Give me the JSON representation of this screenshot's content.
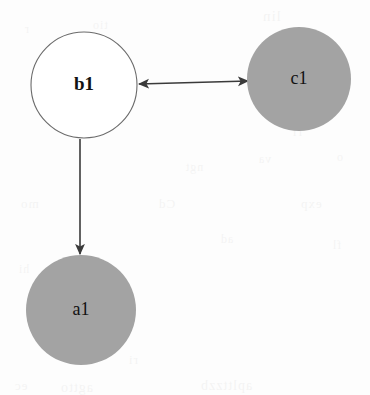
{
  "diagram": {
    "type": "directed-graph",
    "canvas": {
      "width": 370,
      "height": 395
    },
    "background_color": "#fdfdfd",
    "node_fill_gray": "#a3a3a3",
    "node_fill_white": "#ffffff",
    "node_stroke": "#5e5e5e",
    "edge_color": "#3a3a3a",
    "label_color": "#121212",
    "nodes": [
      {
        "id": "b1",
        "label": "b1",
        "cx": 84,
        "cy": 85,
        "r": 53,
        "fill": "#ffffff",
        "stroke": "#6b6b6b",
        "stroke_width": 1.1,
        "font_size": 19,
        "font_weight": "bold"
      },
      {
        "id": "c1",
        "label": "c1",
        "cx": 299,
        "cy": 79,
        "r": 52,
        "fill": "#a3a3a3",
        "stroke": "none",
        "stroke_width": 0,
        "font_size": 18,
        "font_weight": "normal"
      },
      {
        "id": "a1",
        "label": "a1",
        "cx": 81,
        "cy": 310,
        "r": 55,
        "fill": "#a3a3a3",
        "stroke": "none",
        "stroke_width": 0,
        "font_size": 18,
        "font_weight": "normal"
      }
    ],
    "edges": [
      {
        "id": "b1-c1",
        "from": "b1",
        "to": "c1",
        "direction": "bidirectional",
        "x1": 139,
        "y1": 84,
        "x2": 248,
        "y2": 81
      },
      {
        "id": "b1-a1",
        "from": "b1",
        "to": "a1",
        "direction": "forward",
        "x1": 80,
        "y1": 139,
        "x2": 80,
        "y2": 254
      }
    ],
    "ghost_text": [
      {
        "text": "lin",
        "x": 262,
        "y": 8,
        "size": 15
      },
      {
        "text": "tio",
        "x": 92,
        "y": 18,
        "size": 12
      },
      {
        "text": "r",
        "x": 24,
        "y": 22,
        "size": 12
      },
      {
        "text": "ri",
        "x": 292,
        "y": 124,
        "size": 13
      },
      {
        "text": "ngt",
        "x": 185,
        "y": 160,
        "size": 12
      },
      {
        "text": "va",
        "x": 258,
        "y": 152,
        "size": 12
      },
      {
        "text": "o",
        "x": 336,
        "y": 150,
        "size": 12
      },
      {
        "text": "mo",
        "x": 20,
        "y": 196,
        "size": 13
      },
      {
        "text": "Cd",
        "x": 158,
        "y": 196,
        "size": 13
      },
      {
        "text": "exp",
        "x": 300,
        "y": 196,
        "size": 13
      },
      {
        "text": "ad",
        "x": 220,
        "y": 232,
        "size": 12
      },
      {
        "text": "fl",
        "x": 332,
        "y": 238,
        "size": 12
      },
      {
        "text": "hi",
        "x": 18,
        "y": 262,
        "size": 12
      },
      {
        "text": "ri",
        "x": 128,
        "y": 352,
        "size": 13
      },
      {
        "text": "ec",
        "x": 14,
        "y": 378,
        "size": 13
      },
      {
        "text": "agtto",
        "x": 60,
        "y": 380,
        "size": 14
      },
      {
        "text": "aplttzzb",
        "x": 200,
        "y": 378,
        "size": 14
      }
    ]
  }
}
